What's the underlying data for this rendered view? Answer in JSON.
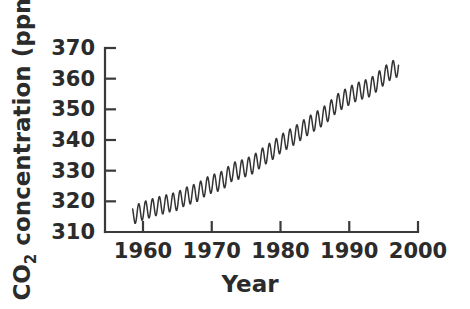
{
  "chart_data": {
    "type": "line",
    "title": "",
    "xlabel": "Year",
    "ylabel": "CO2 concentration (ppm)",
    "ylabel_parts": {
      "prefix": "CO",
      "subscript": "2",
      "suffix": " concentration (ppm)"
    },
    "xlim": [
      1956,
      2000
    ],
    "ylim": [
      310,
      370
    ],
    "xticks": [
      1960,
      1970,
      1980,
      1990,
      2000
    ],
    "xtick_labels": [
      "1960",
      "1970",
      "1980",
      "1990",
      "2000"
    ],
    "yticks": [
      310,
      320,
      330,
      340,
      350,
      360,
      370
    ],
    "ytick_labels": [
      "310",
      "320",
      "330",
      "340",
      "350",
      "360",
      "370"
    ],
    "grid": false,
    "legend": false,
    "legend_position": "none",
    "line_color": "#333333",
    "series": [
      {
        "name": "Atmospheric CO2 concentration (monthly, Mauna Loa)",
        "description": "Rising trend with annual seasonal sawtooth oscillation of about 6 ppm peak-to-trough",
        "x_start": 1958.5,
        "x_end": 1997.2,
        "samples_per_year": 12,
        "seasonal_amplitude_ppm": 3.0,
        "seasonal_peak_month_fraction": 0.38,
        "annual_means": [
          {
            "year": 1958.5,
            "value": 315.3
          },
          {
            "year": 1959,
            "value": 315.9
          },
          {
            "year": 1960,
            "value": 316.9
          },
          {
            "year": 1961,
            "value": 317.6
          },
          {
            "year": 1962,
            "value": 318.4
          },
          {
            "year": 1963,
            "value": 318.9
          },
          {
            "year": 1964,
            "value": 319.6
          },
          {
            "year": 1965,
            "value": 320.0
          },
          {
            "year": 1966,
            "value": 321.4
          },
          {
            "year": 1967,
            "value": 322.2
          },
          {
            "year": 1968,
            "value": 323.0
          },
          {
            "year": 1969,
            "value": 324.6
          },
          {
            "year": 1970,
            "value": 325.7
          },
          {
            "year": 1971,
            "value": 326.3
          },
          {
            "year": 1972,
            "value": 327.5
          },
          {
            "year": 1973,
            "value": 329.7
          },
          {
            "year": 1974,
            "value": 330.2
          },
          {
            "year": 1975,
            "value": 331.1
          },
          {
            "year": 1976,
            "value": 332.0
          },
          {
            "year": 1977,
            "value": 333.8
          },
          {
            "year": 1978,
            "value": 335.4
          },
          {
            "year": 1979,
            "value": 336.8
          },
          {
            "year": 1980,
            "value": 338.7
          },
          {
            "year": 1981,
            "value": 340.1
          },
          {
            "year": 1982,
            "value": 341.4
          },
          {
            "year": 1983,
            "value": 343.0
          },
          {
            "year": 1984,
            "value": 344.6
          },
          {
            "year": 1985,
            "value": 346.0
          },
          {
            "year": 1986,
            "value": 347.4
          },
          {
            "year": 1987,
            "value": 349.2
          },
          {
            "year": 1988,
            "value": 351.6
          },
          {
            "year": 1989,
            "value": 353.1
          },
          {
            "year": 1990,
            "value": 354.4
          },
          {
            "year": 1991,
            "value": 355.6
          },
          {
            "year": 1992,
            "value": 356.4
          },
          {
            "year": 1993,
            "value": 357.1
          },
          {
            "year": 1994,
            "value": 358.8
          },
          {
            "year": 1995,
            "value": 360.8
          },
          {
            "year": 1996,
            "value": 362.6
          },
          {
            "year": 1997.2,
            "value": 363.7
          }
        ]
      }
    ]
  },
  "axes": {
    "plot_left_px": 105,
    "plot_right_px": 418,
    "plot_top_px": 48,
    "plot_bottom_px": 232
  }
}
